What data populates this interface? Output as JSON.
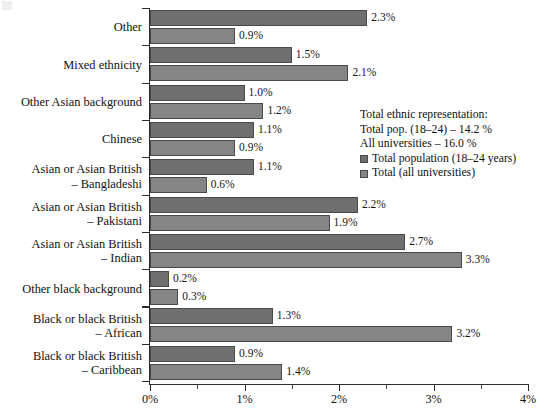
{
  "chart_data": {
    "type": "bar",
    "orientation": "horizontal",
    "title": "",
    "xlabel": "",
    "ylabel": "",
    "xlim": [
      0,
      4
    ],
    "xtick_labels": [
      "0%",
      "1%",
      "2%",
      "3%",
      "4%"
    ],
    "xtick_values": [
      0,
      1,
      2,
      3,
      4
    ],
    "xminor_values": [
      0.5,
      1.5,
      2.5,
      3.5
    ],
    "grid": false,
    "legend_position": "upper-right-inside",
    "categories": [
      "Other",
      "Mixed ethnicity",
      "Other Asian background",
      "Chinese",
      "Asian or Asian British\n– Bangladeshi",
      "Asian or Asian British\n– Pakistani",
      "Asian or Asian British\n– Indian",
      "Other black background",
      "Black or black British\n– African",
      "Black or black British\n– Caribbean"
    ],
    "category_lines": [
      [
        "Other"
      ],
      [
        "Mixed ethnicity"
      ],
      [
        "Other Asian background"
      ],
      [
        "Chinese"
      ],
      [
        "Asian or Asian British",
        "– Bangladeshi"
      ],
      [
        "Asian or Asian British",
        "– Pakistani"
      ],
      [
        "Asian or Asian British",
        "– Indian"
      ],
      [
        "Other black background"
      ],
      [
        "Black or black British",
        "– African"
      ],
      [
        "Black or black British",
        "– Caribbean"
      ]
    ],
    "series": [
      {
        "name": "Total population (18–24 years)",
        "color": "#6f6f6f",
        "values": [
          2.3,
          1.5,
          1.0,
          1.1,
          1.1,
          2.2,
          2.7,
          0.2,
          1.3,
          0.9
        ],
        "labels": [
          "2.3%",
          "1.5%",
          "1.0%",
          "1.1%",
          "1.1%",
          "2.2%",
          "2.7%",
          "0.2%",
          "1.3%",
          "0.9%"
        ]
      },
      {
        "name": "Total (all universities)",
        "color": "#858585",
        "values": [
          0.9,
          2.1,
          1.2,
          0.9,
          0.6,
          1.9,
          3.3,
          0.3,
          3.2,
          1.4
        ],
        "labels": [
          "0.9%",
          "2.1%",
          "1.2%",
          "0.9%",
          "0.6%",
          "1.9%",
          "3.3%",
          "0.3%",
          "3.2%",
          "1.4%"
        ]
      }
    ],
    "annotations": [
      "Total ethnic representation:",
      "Total pop. (18–24) – 14.2 %",
      "All universities – 16.0 %"
    ]
  },
  "legend": {
    "note_line_1": "Total ethnic representation:",
    "note_line_2": "Total pop. (18–24) – 14.2 %",
    "note_line_3": "All universities – 16.0 %",
    "entries": [
      {
        "label": "Total population (18–24 years)",
        "color": "#6f6f6f"
      },
      {
        "label": "Total (all universities)",
        "color": "#858585"
      }
    ]
  },
  "colors": {
    "series_0": "#6f6f6f",
    "series_1": "#858585",
    "axis": "#2b2b2b",
    "text": "#111111",
    "background": "#ffffff"
  }
}
